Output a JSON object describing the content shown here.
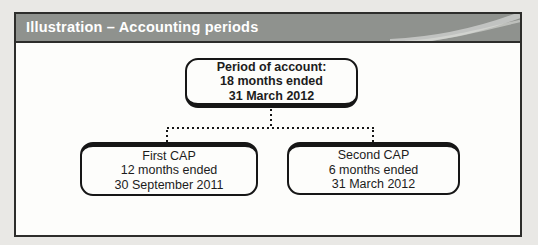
{
  "header": {
    "title": "Illustration – Accounting periods"
  },
  "diagram": {
    "root": {
      "line1": "Period of account:",
      "line2": "18 months ended",
      "line3": "31 March 2012"
    },
    "left": {
      "line1": "First CAP",
      "line2": "12 months ended",
      "line3": "30 September 2011"
    },
    "right": {
      "line1": "Second CAP",
      "line2": "6 months ended",
      "line3": "31 March 2012"
    }
  },
  "colors": {
    "page-bg": "#e9e8e5",
    "panel-bg": "#fdfdfb",
    "panel-border": "#2d2d2b",
    "header-bg": "#8f928e",
    "header-text": "#ffffff",
    "box-border": "#161616",
    "box-text": "#1c1c1c",
    "connector": "#161616"
  }
}
